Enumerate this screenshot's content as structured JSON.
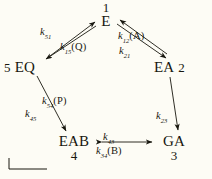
{
  "figure": {
    "background_color": "#fdfcf5",
    "ink_color": "#18170f",
    "type": "reaction-scheme-pentagon"
  },
  "nodes": [
    {
      "id": "E",
      "label": "E",
      "number": "1",
      "number_position": "above"
    },
    {
      "id": "EA",
      "label": "EA",
      "number": "2",
      "number_position": "right"
    },
    {
      "id": "GA",
      "label": "GA",
      "number": "3",
      "number_position": "below"
    },
    {
      "id": "EAB",
      "label": "EAB",
      "number": "4",
      "number_position": "below"
    },
    {
      "id": "EQ",
      "label": "EQ",
      "number": "5",
      "number_position": "left"
    }
  ],
  "node_inline": {
    "eq": {
      "number": "5",
      "label": "EQ"
    },
    "ea": {
      "label": "EA",
      "number": "2"
    }
  },
  "edges": [
    {
      "id": "e-ea",
      "from": "E",
      "to": "EA",
      "forward_label": "k12A",
      "reverse_label": "k21",
      "bidirectional": true
    },
    {
      "id": "ea-ga",
      "from": "EA",
      "to": "GA",
      "forward_label": "k23",
      "reverse_label": "",
      "bidirectional": false
    },
    {
      "id": "ga-eab",
      "from": "GA",
      "to": "EAB",
      "forward_label": "k34B",
      "reverse_label": "k43",
      "bidirectional": true
    },
    {
      "id": "eab-eq",
      "from": "EAB",
      "to": "EQ",
      "forward_label": "k45",
      "reverse_label": "k54P",
      "bidirectional": true
    },
    {
      "id": "eq-e",
      "from": "EQ",
      "to": "E",
      "forward_label": "k51",
      "reverse_label": "k15Q",
      "bidirectional": true
    }
  ],
  "rates": {
    "k51": {
      "k": "k",
      "sub": "51",
      "species": ""
    },
    "k15q": {
      "k": "k",
      "sub": "15",
      "species": "(Q)"
    },
    "k12a": {
      "k": "k",
      "sub": "12",
      "species": "(A)"
    },
    "k21": {
      "k": "k",
      "sub": "21",
      "species": ""
    },
    "k23": {
      "k": "k",
      "sub": "23",
      "species": ""
    },
    "k43": {
      "k": "k",
      "sub": "43",
      "species": ""
    },
    "k34b": {
      "k": "k",
      "sub": "34",
      "species": "(B)"
    },
    "k54p": {
      "k": "k",
      "sub": "54",
      "species": "(P)"
    },
    "k45": {
      "k": "k",
      "sub": "45",
      "species": ""
    }
  },
  "scale_bar": {
    "shown": true,
    "label": ""
  }
}
